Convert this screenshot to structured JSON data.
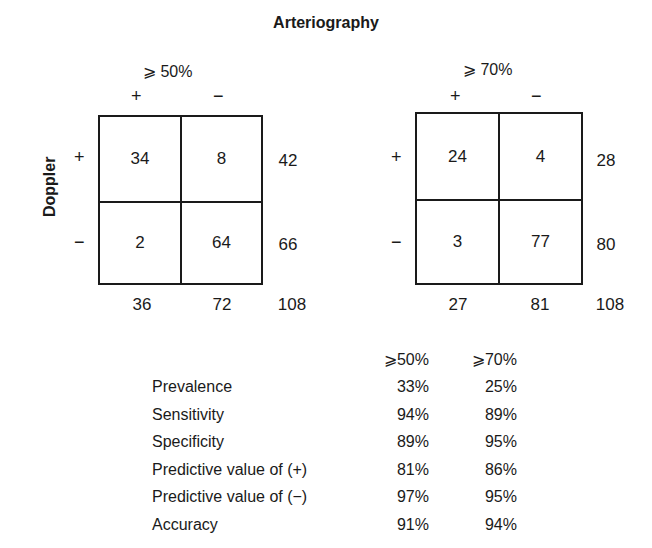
{
  "title": "Arteriography",
  "row_axis_label": "Doppler",
  "tables": [
    {
      "threshold": "⩾ 50%",
      "col_headers": [
        "+",
        "−"
      ],
      "row_headers": [
        "+",
        "−"
      ],
      "cells": [
        [
          "34",
          "8"
        ],
        [
          "2",
          "64"
        ]
      ],
      "row_totals": [
        "42",
        "66"
      ],
      "col_totals": [
        "36",
        "72"
      ],
      "grand_total": "108"
    },
    {
      "threshold": "⩾ 70%",
      "col_headers": [
        "+",
        "−"
      ],
      "row_headers": [
        "+",
        "−"
      ],
      "cells": [
        [
          "24",
          "4"
        ],
        [
          "3",
          "77"
        ]
      ],
      "row_totals": [
        "28",
        "80"
      ],
      "col_totals": [
        "27",
        "81"
      ],
      "grand_total": "108"
    }
  ],
  "stats": {
    "headers": [
      "",
      "⩾50%",
      "⩾70%"
    ],
    "rows": [
      {
        "label": "Prevalence",
        "v50": "33%",
        "v70": "25%"
      },
      {
        "label": "Sensitivity",
        "v50": "94%",
        "v70": "89%"
      },
      {
        "label": "Specificity",
        "v50": "89%",
        "v70": "95%"
      },
      {
        "label": "Predictive value of (+)",
        "v50": "81%",
        "v70": "86%"
      },
      {
        "label": "Predictive value of (−)",
        "v50": "97%",
        "v70": "95%"
      },
      {
        "label": "Accuracy",
        "v50": "91%",
        "v70": "94%"
      }
    ]
  }
}
